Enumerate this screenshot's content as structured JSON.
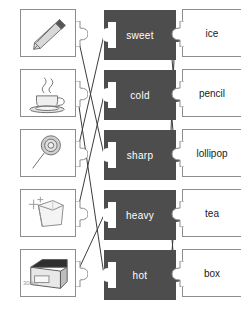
{
  "worksheet": {
    "title": "Matching puzzle worksheet",
    "type": "three-column matching activity"
  },
  "columns": {
    "left": {
      "name": "picture-cards",
      "items": [
        {
          "id": "pencil",
          "icon": "pencil-icon",
          "alt": "pencil"
        },
        {
          "id": "cup",
          "icon": "teacup-icon",
          "alt": "cup of hot tea with steam"
        },
        {
          "id": "lollipop",
          "icon": "lollipop-icon",
          "alt": "lollipop"
        },
        {
          "id": "icecube",
          "icon": "ice-cube-icon",
          "alt": "ice cube"
        },
        {
          "id": "heavybox",
          "icon": "heavy-box-icon",
          "alt": "heavy box",
          "weight_label": "30 kg"
        }
      ]
    },
    "middle": {
      "name": "adjective-cards",
      "items": [
        {
          "id": "sweet",
          "label": "sweet"
        },
        {
          "id": "cold",
          "label": "cold"
        },
        {
          "id": "sharp",
          "label": "sharp"
        },
        {
          "id": "heavy",
          "label": "heavy"
        },
        {
          "id": "hot",
          "label": "hot"
        }
      ]
    },
    "right": {
      "name": "noun-cards",
      "items": [
        {
          "id": "ice",
          "label": "ice"
        },
        {
          "id": "pencil",
          "label": "pencil"
        },
        {
          "id": "lollipop",
          "label": "lollipop"
        },
        {
          "id": "tea",
          "label": "tea"
        },
        {
          "id": "box",
          "label": "box"
        }
      ]
    }
  },
  "connections": {
    "left_to_middle": [
      {
        "from": "pencil",
        "to": "sharp"
      },
      {
        "from": "cup",
        "to": "hot"
      },
      {
        "from": "lollipop",
        "to": "sweet"
      },
      {
        "from": "icecube",
        "to": "cold"
      },
      {
        "from": "heavybox",
        "to": "heavy"
      }
    ],
    "middle_to_right": [
      {
        "from": "sweet",
        "to": "lollipop"
      },
      {
        "from": "cold",
        "to": "ice"
      },
      {
        "from": "sharp",
        "to": "pencil"
      },
      {
        "from": "heavy",
        "to": "box"
      },
      {
        "from": "hot",
        "to": "tea"
      }
    ]
  },
  "colors": {
    "card_fill_dark": "#4d4d4d",
    "card_text_light": "#ffffff",
    "card_border": "#8d8d8d",
    "line": "#3c3c3c",
    "background": "#ffffff"
  }
}
